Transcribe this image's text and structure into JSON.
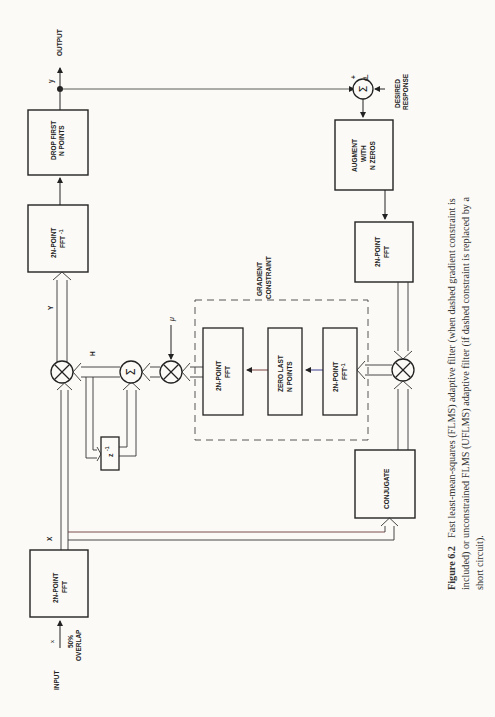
{
  "figure": {
    "number": "Figure 6.2",
    "caption_lines": [
      "Fast least-mean-squares (FLMS) adaptive filter (when dashed gradient constraint is",
      "included) or unconstrained FLMS (UFLMS) adaptive filter (if dashed constraint is replaced by a",
      "short circuit)."
    ]
  },
  "blocks": {
    "drop_first": [
      "DROP FIRST",
      "N POINTS"
    ],
    "ifft_out": [
      "2N-POINT",
      "FFT"
    ],
    "ifft_out_sup": "-1",
    "input_fft": [
      "2N-POINT",
      "FFT"
    ],
    "conjugate": [
      "CONJUGATE"
    ],
    "augment": [
      "AUGMENT",
      "WITH",
      "N ZEROS"
    ],
    "error_fft": [
      "2N-POINT",
      "FFT"
    ],
    "constraint_fft": [
      "2N-POINT",
      "FFT"
    ],
    "zero_last": [
      "ZERO LAST",
      "N POINTS"
    ],
    "constraint_ifft": [
      "2N-POINT",
      "FFT"
    ],
    "constraint_ifft_sup": "-1",
    "delay": "z",
    "delay_sup": "-1"
  },
  "labels": {
    "output": "OUTPUT",
    "input": "INPUT",
    "input_x": "x",
    "overlap": [
      "50%",
      "OVERLAP"
    ],
    "y_time": "y",
    "Y_freq": "Y",
    "X_freq": "X",
    "H": "H",
    "mu": "μ",
    "d": "d",
    "minus": "−",
    "plus": "+",
    "desired": [
      "DESIRED",
      "RESPONSE"
    ],
    "gradient_constraint": [
      "GRADIENT",
      "CONSTRAINT"
    ]
  },
  "symbols": {
    "summer": "Σ",
    "multiplier": "⊗"
  }
}
